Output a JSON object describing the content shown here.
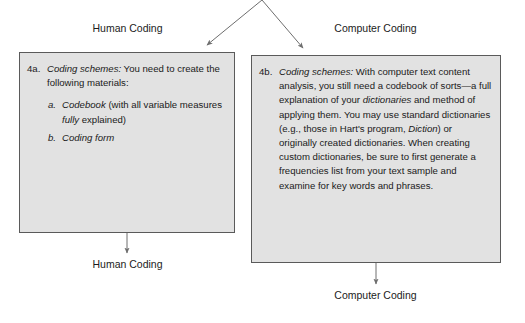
{
  "diagram": {
    "type": "flowchart",
    "background_color": "#ffffff",
    "box_fill_color": "#e2e2e2",
    "box_border_color": "#5a5a5a",
    "arrow_color": "#6e6e6e",
    "branches": [
      {
        "id": "human",
        "top_label": "Human Coding",
        "bottom_label": "Human Coding"
      },
      {
        "id": "computer",
        "top_label": "Computer Coding",
        "bottom_label": "Computer Coding"
      }
    ]
  },
  "labels": {
    "human_top": "Human Coding",
    "computer_top": "Computer Coding",
    "human_bottom": "Human Coding",
    "computer_bottom": "Computer Coding"
  },
  "human_box": {
    "number": "4a.",
    "heading": "Coding schemes:",
    "intro": " You need to create the following materials:",
    "items": [
      {
        "marker": "a.",
        "title": "Codebook",
        "rest_before_italic": " (with all variable measures ",
        "italic_word": "fully",
        "rest_after_italic": " explained)"
      },
      {
        "marker": "b.",
        "title": "Coding form",
        "rest_before_italic": "",
        "italic_word": "",
        "rest_after_italic": ""
      }
    ]
  },
  "computer_box": {
    "number": "4b.",
    "heading": "Coding schemes:",
    "seg1": " With computer text content analysis, you still need a codebook of sorts—a full explanation of your ",
    "italic1": "dictionaries",
    "seg2": " and method of applying them. You may use standard dictionaries (e.g., those in Hart's program, ",
    "italic2": "Diction",
    "seg3": ") or originally created dictionaries. When creating custom dictionaries, be sure to first generate a frequencies list from your text sample and examine for key words and phrases."
  }
}
